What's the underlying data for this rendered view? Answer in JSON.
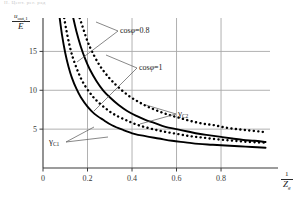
{
  "page": {
    "top_note": "II. Цент. рег. рад"
  },
  "axes": {
    "y_label": {
      "numerator": "u",
      "numerator_sub": "out,1",
      "denominator": "E"
    },
    "x_label": {
      "numerator": "1",
      "denominator": "Z",
      "denominator_sub": "g"
    },
    "x_ticks": [
      "0",
      "0.2",
      "0.4",
      "0.6",
      "0.8"
    ],
    "x_tick_values": [
      0,
      0.2,
      0.4,
      0.6,
      0.8
    ],
    "y_ticks": [
      "5",
      "10",
      "15"
    ],
    "y_tick_values": [
      5,
      10,
      15
    ],
    "xlim": [
      0,
      1.02
    ],
    "ylim": [
      0,
      19.3
    ],
    "grid": "on",
    "grid_color": "#a8a8a8",
    "axis_color": "#3a3a3a"
  },
  "annotations": [
    {
      "id": "cos-phi-08",
      "text_pre": "cos",
      "text_phi": "φ",
      "text_post": "=0.8"
    },
    {
      "id": "cos-phi-1",
      "text_pre": "cos",
      "text_phi": "φ",
      "text_post": "=1"
    },
    {
      "id": "gamma-c2",
      "symbol": "γ",
      "sub": "C2"
    },
    {
      "id": "gamma-c1",
      "symbol": "γ",
      "sub": "C1"
    }
  ],
  "chart_data": {
    "type": "line",
    "title": "",
    "xlabel": "1/Zg",
    "ylabel": "u_out,1 / E",
    "xlim": [
      0,
      1.02
    ],
    "ylim": [
      0,
      19.3
    ],
    "grid": true,
    "legend": "inline-annotations",
    "series": [
      {
        "name": "gamma_C2",
        "label": "γC2",
        "style": "solid",
        "color": "#000000",
        "note": "cosφ=1 upper solid curve",
        "x": [
          0.136,
          0.15,
          0.17,
          0.19,
          0.21,
          0.24,
          0.27,
          0.3,
          0.34,
          0.38,
          0.42,
          0.46,
          0.5,
          0.55,
          0.6,
          0.65,
          0.7,
          0.75,
          0.8,
          0.85,
          0.9,
          0.95,
          1.0
        ],
        "y": [
          19.3,
          17.6,
          15.6,
          14.0,
          12.7,
          11.2,
          10.0,
          9.1,
          8.1,
          7.3,
          6.7,
          6.2,
          5.8,
          5.3,
          5.0,
          4.7,
          4.4,
          4.2,
          4.0,
          3.8,
          3.6,
          3.5,
          3.35
        ]
      },
      {
        "name": "gamma_C2_dotted",
        "label": "cosφ=0.8 (dotted, upper)",
        "style": "dotted",
        "color": "#000000",
        "x": [
          0.165,
          0.18,
          0.2,
          0.22,
          0.25,
          0.28,
          0.31,
          0.35,
          0.39,
          0.43,
          0.47,
          0.52,
          0.57,
          0.62,
          0.67,
          0.72,
          0.77,
          0.82,
          0.87,
          0.92,
          0.97,
          1.0
        ],
        "y": [
          19.3,
          18.0,
          16.3,
          15.0,
          13.4,
          12.2,
          11.2,
          10.1,
          9.2,
          8.5,
          7.9,
          7.3,
          6.8,
          6.4,
          6.0,
          5.7,
          5.5,
          5.2,
          5.0,
          4.85,
          4.7,
          4.6
        ]
      },
      {
        "name": "gamma_C1",
        "label": "γC1",
        "style": "solid",
        "color": "#000000",
        "note": "cosφ=1 lower solid curve",
        "x": [
          0.075,
          0.085,
          0.1,
          0.115,
          0.13,
          0.15,
          0.17,
          0.2,
          0.23,
          0.27,
          0.31,
          0.36,
          0.41,
          0.46,
          0.52,
          0.58,
          0.64,
          0.7,
          0.76,
          0.82,
          0.88,
          0.94,
          1.0
        ],
        "y": [
          19.3,
          17.2,
          14.8,
          13.0,
          11.6,
          10.2,
          9.1,
          7.9,
          7.0,
          6.2,
          5.5,
          4.9,
          4.4,
          4.1,
          3.8,
          3.5,
          3.3,
          3.1,
          3.0,
          2.9,
          2.8,
          2.7,
          2.6
        ]
      },
      {
        "name": "gamma_C1_dotted",
        "label": "cosφ=0.8 (dotted, lower)",
        "style": "dotted",
        "color": "#000000",
        "x": [
          0.095,
          0.11,
          0.125,
          0.14,
          0.16,
          0.18,
          0.21,
          0.24,
          0.28,
          0.32,
          0.37,
          0.42,
          0.48,
          0.54,
          0.6,
          0.66,
          0.72,
          0.78,
          0.84,
          0.9,
          0.96,
          1.0
        ],
        "y": [
          19.3,
          17.0,
          15.1,
          13.7,
          12.2,
          11.0,
          9.7,
          8.7,
          7.7,
          6.9,
          6.2,
          5.6,
          5.1,
          4.7,
          4.4,
          4.1,
          3.9,
          3.7,
          3.55,
          3.4,
          3.3,
          3.25
        ]
      }
    ]
  },
  "colors": {
    "curve": "#000000",
    "grid": "#a8a8a8",
    "axis": "#3a3a3a",
    "leader": "#555555"
  }
}
